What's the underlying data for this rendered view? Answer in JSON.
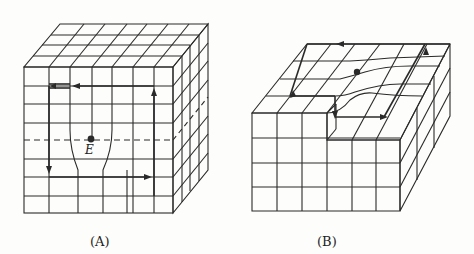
{
  "figures": [
    {
      "id": "A",
      "label": "(A)",
      "point_label": "E"
    },
    {
      "id": "B",
      "label": "(B)"
    }
  ],
  "colors": {
    "line": "#2a2a2a",
    "background": "#fdfdfb"
  }
}
